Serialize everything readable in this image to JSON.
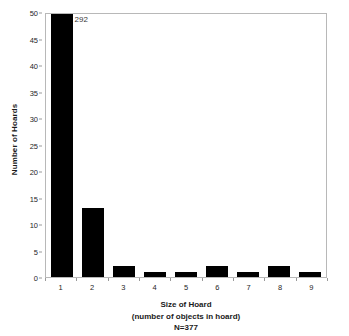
{
  "chart_data": {
    "type": "bar",
    "title": "",
    "subtitle": "",
    "xlabel": "Size of Hoard",
    "xlabel_line2": "(number of objects in hoard)",
    "xlabel_line3": "N=377",
    "ylabel": "Number of Hoards",
    "categories": [
      "1",
      "2",
      "3",
      "4",
      "5",
      "6",
      "7",
      "8",
      "9"
    ],
    "values": [
      292,
      13,
      2,
      1,
      1,
      2,
      1,
      2,
      1
    ],
    "bar_labels": [
      "292",
      "",
      "",
      "",
      "",
      "",
      "",
      "",
      ""
    ],
    "ylim": [
      0,
      50
    ],
    "yticks": [
      0,
      5,
      10,
      15,
      20,
      25,
      30,
      35,
      40,
      45,
      50
    ],
    "ytick_labels": [
      "0",
      "5",
      "10",
      "15",
      "20",
      "25",
      "30",
      "35",
      "40",
      "45",
      "50"
    ],
    "grid": false,
    "legend": false,
    "legend_position": "none",
    "bar_color": "#000000",
    "frame_color": "#b8b8b8",
    "background": "#ffffff",
    "note": "First bar value 292 exceeds axis maximum 50 and is clipped at the top of the plot, annotated with its value."
  },
  "axis": {
    "y_title": "Number of Hoards"
  },
  "caption": {
    "line1": "Size of Hoard",
    "line2": "(number of objects in hoard)",
    "line3": "N=377"
  }
}
